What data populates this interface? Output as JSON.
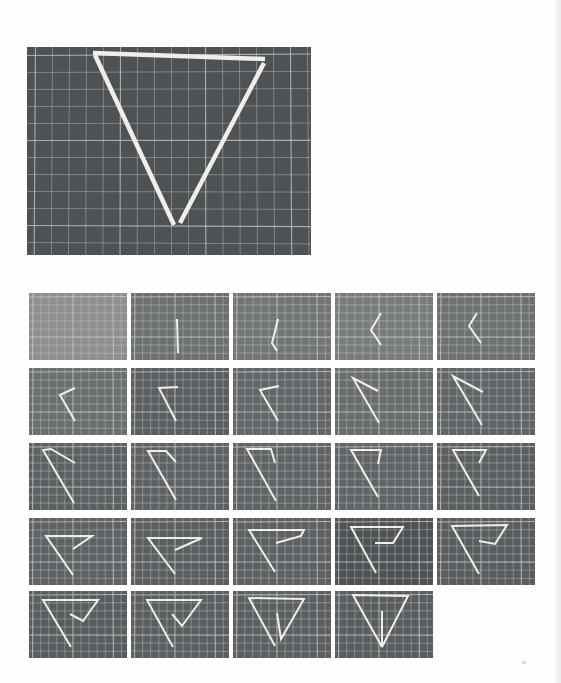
{
  "page": {
    "background": "#fefefe",
    "mat_color": "#55585a",
    "grid_line_color": "#c9cbcc",
    "straw_color": "#eeeeea"
  },
  "main_figure": {
    "description": "Triangle made of three straws on a cutting mat",
    "rect": {
      "x": 27,
      "y": 47,
      "w": 284,
      "h": 208
    },
    "mat_color": "#4f5254",
    "grid_step": 17,
    "straws": [
      [
        [
          66,
          6
        ],
        [
          238,
          12
        ]
      ],
      [
        [
          68,
          8
        ],
        [
          147,
          178
        ]
      ],
      [
        [
          237,
          16
        ],
        [
          153,
          176
        ]
      ]
    ]
  },
  "sequence_figure": {
    "description": "Step-by-step sequence of folding a single straw into a triangle",
    "tile_size": {
      "w": 98,
      "h": 67
    },
    "columns_x": [
      29,
      131,
      233,
      335,
      437
    ],
    "rows_y": [
      293,
      368,
      443,
      518,
      591
    ],
    "grid_step": 8,
    "tiles": [
      {
        "step": 1,
        "mat": "#8d8f90",
        "path": []
      },
      {
        "step": 2,
        "mat": "#6d7071",
        "path": [
          [
            46,
            26
          ],
          [
            47,
            60
          ]
        ]
      },
      {
        "step": 3,
        "mat": "#727576",
        "path": [
          [
            45,
            26
          ],
          [
            39,
            50
          ],
          [
            44,
            58
          ]
        ]
      },
      {
        "step": 4,
        "mat": "#787b7c",
        "path": [
          [
            46,
            20
          ],
          [
            36,
            37
          ],
          [
            46,
            52
          ]
        ]
      },
      {
        "step": 5,
        "mat": "#6e7172",
        "path": [
          [
            40,
            20
          ],
          [
            32,
            33
          ],
          [
            44,
            50
          ]
        ]
      },
      {
        "step": 6,
        "mat": "#6c6f70",
        "path": [
          [
            46,
            20
          ],
          [
            31,
            27
          ],
          [
            46,
            53
          ]
        ]
      },
      {
        "step": 7,
        "mat": "#5b5e60",
        "path": [
          [
            47,
            19
          ],
          [
            28,
            20
          ],
          [
            45,
            53
          ]
        ]
      },
      {
        "step": 8,
        "mat": "#636668",
        "path": [
          [
            46,
            18
          ],
          [
            27,
            22
          ],
          [
            45,
            53
          ]
        ]
      },
      {
        "step": 9,
        "mat": "#6a6d6e",
        "path": [
          [
            43,
            23
          ],
          [
            18,
            10
          ],
          [
            44,
            55
          ]
        ]
      },
      {
        "step": 10,
        "mat": "#626567",
        "path": [
          [
            46,
            24
          ],
          [
            16,
            8
          ],
          [
            45,
            57
          ]
        ]
      },
      {
        "step": 11,
        "mat": "#5d6062",
        "path": [
          [
            46,
            20
          ],
          [
            22,
            6
          ],
          [
            14,
            7
          ],
          [
            45,
            60
          ]
        ]
      },
      {
        "step": 12,
        "mat": "#5f6264",
        "path": [
          [
            45,
            19
          ],
          [
            35,
            8
          ],
          [
            17,
            8
          ],
          [
            45,
            57
          ]
        ]
      },
      {
        "step": 13,
        "mat": "#606365",
        "path": [
          [
            42,
            20
          ],
          [
            38,
            6
          ],
          [
            14,
            6
          ],
          [
            43,
            58
          ]
        ]
      },
      {
        "step": 14,
        "mat": "#616466",
        "path": [
          [
            43,
            21
          ],
          [
            46,
            7
          ],
          [
            16,
            7
          ],
          [
            43,
            54
          ]
        ]
      },
      {
        "step": 15,
        "mat": "#5c5f61",
        "path": [
          [
            42,
            20
          ],
          [
            49,
            7
          ],
          [
            16,
            7
          ],
          [
            42,
            53
          ]
        ]
      },
      {
        "step": 16,
        "mat": "#5f6264",
        "path": [
          [
            44,
            31
          ],
          [
            63,
            18
          ],
          [
            17,
            18
          ],
          [
            44,
            57
          ]
        ]
      },
      {
        "step": 17,
        "mat": "#5b5e60",
        "path": [
          [
            44,
            32
          ],
          [
            71,
            20
          ],
          [
            17,
            20
          ],
          [
            44,
            56
          ]
        ]
      },
      {
        "step": 18,
        "mat": "#5d6062",
        "path": [
          [
            43,
            25
          ],
          [
            68,
            18
          ],
          [
            71,
            12
          ],
          [
            16,
            12
          ],
          [
            42,
            54
          ]
        ]
      },
      {
        "step": 19,
        "mat": "#4f5254",
        "path": [
          [
            40,
            25
          ],
          [
            58,
            25
          ],
          [
            68,
            9
          ],
          [
            16,
            9
          ],
          [
            41,
            55
          ]
        ]
      },
      {
        "step": 20,
        "mat": "#5a5d5f",
        "path": [
          [
            42,
            23
          ],
          [
            58,
            26
          ],
          [
            70,
            7
          ],
          [
            15,
            8
          ],
          [
            42,
            56
          ]
        ]
      },
      {
        "step": 21,
        "mat": "#5a5d5f",
        "path": [
          [
            41,
            23
          ],
          [
            54,
            30
          ],
          [
            69,
            9
          ],
          [
            14,
            9
          ],
          [
            42,
            56
          ]
        ]
      },
      {
        "step": 22,
        "mat": "#5b5e60",
        "path": [
          [
            41,
            23
          ],
          [
            51,
            35
          ],
          [
            70,
            9
          ],
          [
            16,
            9
          ],
          [
            42,
            56
          ]
        ]
      },
      {
        "step": 23,
        "mat": "#5c5f61",
        "path": [
          [
            44,
            22
          ],
          [
            48,
            48
          ],
          [
            71,
            8
          ],
          [
            16,
            7
          ],
          [
            42,
            55
          ]
        ]
      },
      {
        "step": 24,
        "mat": "#5a5d5f",
        "path": [
          [
            47,
            20
          ],
          [
            47,
            56
          ],
          [
            73,
            5
          ],
          [
            18,
            4
          ],
          [
            47,
            56
          ]
        ]
      }
    ]
  }
}
